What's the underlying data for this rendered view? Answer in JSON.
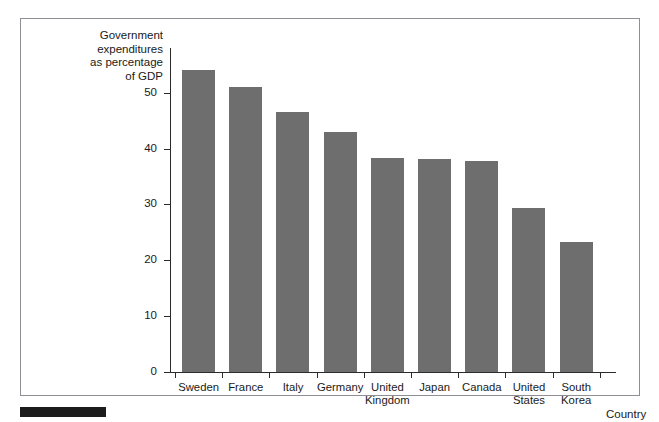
{
  "figure": {
    "background_color": "#ffffff",
    "frame_color": "#8e8e94",
    "bar_color": "#6e6e6e",
    "axis_color": "#2b2b2b",
    "footer_rule_color": "#1c1c1c"
  },
  "chart_data": {
    "type": "bar",
    "title": "",
    "ylabel": "Government\nexpenditures\nas percentage\nof GDP",
    "xlabel": "Country",
    "categories": [
      "Sweden",
      "France",
      "Italy",
      "Germany",
      "United\nKingdom",
      "Japan",
      "Canada",
      "United\nStates",
      "South\nKorea"
    ],
    "values": [
      54.1,
      51.1,
      46.6,
      42.9,
      38.4,
      38.2,
      37.8,
      29.3,
      23.3
    ],
    "ylim": [
      0,
      58
    ],
    "yticks": [
      0,
      10,
      20,
      30,
      40,
      50
    ],
    "ytick_labels": [
      "0",
      "10",
      "20",
      "30",
      "40",
      "50"
    ],
    "grid": false,
    "legend": null,
    "series_color": "#6e6e6e"
  }
}
